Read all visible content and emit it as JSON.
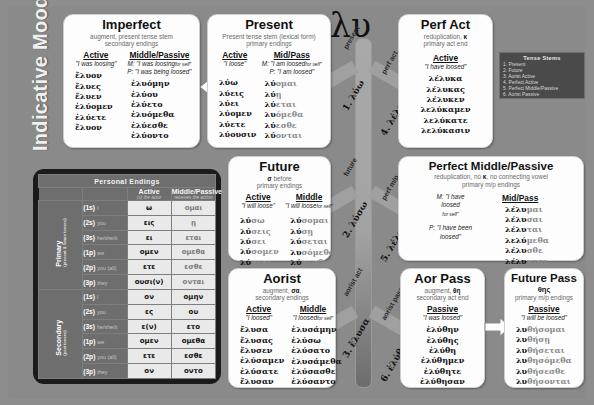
{
  "mood": {
    "label": "Indicative Mood"
  },
  "root_stem": "λυ",
  "legend": {
    "title": "Tense Stems",
    "items": [
      "1. Present",
      "2. Future",
      "3. Aorist Active",
      "4. Perfect Active",
      "5. Perfect Middle/Passive",
      "6. Aorist Passive"
    ]
  },
  "branches": [
    {
      "name": "present",
      "label": "present",
      "stem": "1. λύω"
    },
    {
      "name": "future",
      "label": "future",
      "stem": "2. λύσω"
    },
    {
      "name": "aorist-act",
      "label": "aorist act",
      "stem": "3. ἔλυσα"
    },
    {
      "name": "perf-act",
      "label": "perf act",
      "stem": "4. λέλυκα"
    },
    {
      "name": "perf-mp",
      "label": "perf m/p",
      "stem": "5. λέλυμαι"
    },
    {
      "name": "aor-pass",
      "label": "aorist pass",
      "stem": "6. ἐλύθην"
    }
  ],
  "cards": {
    "imperfect": {
      "title": "Imperfect",
      "sub1": "augment, present tense stem",
      "sub2": "secondary endings",
      "col1": {
        "header": "Active",
        "gloss": "\"I was loosing\"",
        "forms": [
          "ἔλυον",
          "ἔλυες",
          "ἔλυεν",
          "ἐλύομεν",
          "ἐλύετε",
          "ἔλυον"
        ]
      },
      "col2": {
        "header": "Middle/Passive",
        "gloss_m": "M: \"I was loosing",
        "gloss_m_tiny": "for self\"",
        "gloss_p": "P: \"I was being loosed\"",
        "forms": [
          "ἐλυόμην",
          "ἐλύου",
          "ἐλύετο",
          "ἐλυόμεθα",
          "ἐλύεσθε",
          "ἐλύοντο"
        ]
      }
    },
    "present": {
      "title": "Present",
      "sub1": "Present tense stem (lexical form)",
      "sub2": "primary endings",
      "col1": {
        "header": "Active",
        "gloss": "\"I loose\"",
        "forms": [
          "λύω",
          "λύεις",
          "λύει",
          "λύομεν",
          "λύετε",
          "λύουσιν"
        ]
      },
      "col2": {
        "header": "Mid/Pass",
        "gloss_m": "M: \"I am loosed",
        "gloss_m_tiny": "for self\"",
        "gloss_p": "P: \"I am loosed\"",
        "stems": [
          "λύ",
          "λύ",
          "λύ",
          "λυ",
          "λύ",
          "λύ"
        ],
        "endings": [
          "ομαι",
          "ῃ",
          "εται",
          "όμεθα",
          "εσθε",
          "ονται"
        ]
      }
    },
    "future": {
      "title": "Future",
      "sub1_bold": "σ",
      "sub1_rest": " before",
      "sub2": "primary endings",
      "col1": {
        "header": "Active",
        "gloss": "\"I will loose\"",
        "stems": [
          "λύ",
          "λύ",
          "λύ",
          "λύ",
          "λύ",
          "λύ"
        ],
        "endings": [
          "σω",
          "σεις",
          "σει",
          "σομεν",
          "σετε",
          "σουσιν"
        ]
      },
      "col2": {
        "header": "Middle",
        "gloss": "\"I will loose",
        "gloss_tiny": "for self\"",
        "stems": [
          "λύ",
          "λύ",
          "λύ",
          "λυ",
          "λύ",
          "λύ"
        ],
        "endings": [
          "σομαι",
          "σῃ",
          "σεται",
          "σόμεθα",
          "σεσθε",
          "σονται"
        ]
      }
    },
    "aorist": {
      "title": "Aorist",
      "sub1_pre": "augment, ",
      "sub1_bold": "σα",
      "sub1_post": ",",
      "sub2": "secondary endings",
      "col1": {
        "header": "Active",
        "gloss": "\"I loosed\"",
        "forms": [
          "ἔλυσα",
          "ἔλυσας",
          "ἔλυσεν",
          "ἐλύσαμεν",
          "ἐλύσατε",
          "ἔλυσαν"
        ]
      },
      "col2": {
        "header": "Middle",
        "gloss": "\"I loosed",
        "gloss_tiny": "for self\"",
        "forms": [
          "ἐλυσάμην",
          "ἐλύσω",
          "ἐλύσατο",
          "ἐλυσάμεθα",
          "ἐλύσασθε",
          "ἐλύσαντο"
        ]
      }
    },
    "perf_act": {
      "title": "Perf Act",
      "sub1_pre": "reduplication, ",
      "sub1_bold": "κ",
      "sub2": "primary act end",
      "col1": {
        "header": "Active",
        "gloss": "\"I have loosed\"",
        "forms": [
          "λέλυκα",
          "λέλυκας",
          "λέλυκεν",
          "λελύκαμεν",
          "λελύκατε",
          "λελύκασιν"
        ]
      }
    },
    "perf_mp": {
      "title": "Perfect Middle/Passive",
      "sub1_pre": "reduplication, no ",
      "sub1_bold": "κ",
      "sub1_post": ", no connecting vowel",
      "sub2": "primary m/p endings",
      "gloss_m": "M: \"I have",
      "gloss_m2": "loosed",
      "gloss_m3": "for self\"",
      "gloss_p": "P: \"I have been",
      "gloss_p2": "loosed\"",
      "col2": {
        "header": "Mid/Pass",
        "stems": [
          "λέλυ",
          "λέλυ",
          "λέλυ",
          "λελύ",
          "λέλυ",
          "λέλυ"
        ],
        "endings": [
          "μαι",
          "σαι",
          "ται",
          "μεθα",
          "σθε",
          "νται"
        ]
      }
    },
    "aor_pass": {
      "title": "Aor Pass",
      "sub1_pre": "augment, ",
      "sub1_bold": "θη",
      "sub2": "secondary act end",
      "col1": {
        "header": "Passive",
        "gloss": "\"I was loosed\"",
        "forms": [
          "ἐλύθην",
          "ἐλύθης",
          "ἐλύθη",
          "ἐλύθημεν",
          "ἐλύθητε",
          "ἐλύθησαν"
        ]
      }
    },
    "fut_pass": {
      "title": "Future Pass",
      "sub1_bold": "θης",
      "sub2": "primary m/p endings",
      "col1": {
        "header": "Passive",
        "gloss": "\"I will be loosed\"",
        "stems": [
          "λυ",
          "λυ",
          "λυ",
          "λυ",
          "λυ",
          "λυ"
        ],
        "endings": [
          "θήσομαι",
          "θήσῃ",
          "θήσεται",
          "θησόμεθα",
          "θήσεσθε",
          "θήσονται"
        ]
      }
    }
  },
  "personal_endings": {
    "title": "Personal Endings",
    "col_active": "Active",
    "col_active_sub": "(s) the actor",
    "col_mp": "Middle/Passive",
    "col_mp_sub": "receives the action",
    "groups": [
      {
        "name": "Primary",
        "sub": "(present & future tenses)",
        "rows": [
          {
            "person": "(1s)",
            "pronoun": "I",
            "active": "ω",
            "mp": "ομαι"
          },
          {
            "person": "(2s)",
            "pronoun": "you",
            "active": "εις",
            "mp": "ῃ"
          },
          {
            "person": "(3s)",
            "pronoun": "he/she/it",
            "active": "ει",
            "mp": "εται"
          },
          {
            "person": "(1p)",
            "pronoun": "we",
            "active": "ομεν",
            "mp": "ομεθα"
          },
          {
            "person": "(2p)",
            "pronoun": "you (all)",
            "active": "ετε",
            "mp": "εσθε"
          },
          {
            "person": "(3p)",
            "pronoun": "they",
            "active": "ουσι(ν)",
            "mp": "ονται"
          }
        ]
      },
      {
        "name": "Secondary",
        "sub": "(past tenses)",
        "rows": [
          {
            "person": "(1s)",
            "pronoun": "I",
            "active": "ον",
            "mp": "ομην"
          },
          {
            "person": "(2s)",
            "pronoun": "you",
            "active": "ες",
            "mp": "ου"
          },
          {
            "person": "(3s)",
            "pronoun": "he/she/it",
            "active": "ε(ν)",
            "mp": "ετο"
          },
          {
            "person": "(1p)",
            "pronoun": "we",
            "active": "ομεν",
            "mp": "ομεθα"
          },
          {
            "person": "(2p)",
            "pronoun": "you (all)",
            "active": "ετε",
            "mp": "εσθε"
          },
          {
            "person": "(3p)",
            "pronoun": "they",
            "active": "ον",
            "mp": "οντο"
          }
        ]
      }
    ]
  }
}
